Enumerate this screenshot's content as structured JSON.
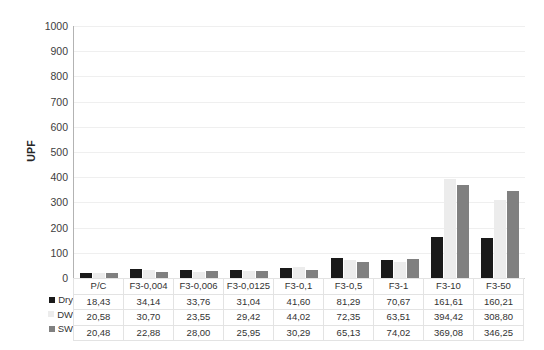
{
  "chart_data": {
    "type": "bar",
    "title": "",
    "xlabel": "",
    "ylabel": "UPF",
    "ylim": [
      0,
      1000
    ],
    "ytick_step": 100,
    "grid": true,
    "legend_position": "data-table-left",
    "categories": [
      "P/C",
      "F3-0,004",
      "F3-0,006",
      "F3-0,0125",
      "F3-0,1",
      "F3-0,5",
      "F3-1",
      "F3-10",
      "F3-50"
    ],
    "yticks": [
      "1000",
      "900",
      "800",
      "700",
      "600",
      "500",
      "400",
      "300",
      "200",
      "100",
      "0"
    ],
    "series": [
      {
        "name": "Dry",
        "color": "#1a1a1a",
        "marker": "black-square",
        "values": [
          18.43,
          34.14,
          33.76,
          31.04,
          41.6,
          81.29,
          70.67,
          161.61,
          160.21
        ],
        "labels": [
          "18,43",
          "34,14",
          "33,76",
          "31,04",
          "41,60",
          "81,29",
          "70,67",
          "161,61",
          "160,21"
        ]
      },
      {
        "name": "DW",
        "color": "#ececec",
        "marker": "light-gray-square",
        "values": [
          20.58,
          30.7,
          23.55,
          29.42,
          44.02,
          72.35,
          63.51,
          394.42,
          308.8
        ],
        "labels": [
          "20,58",
          "30,70",
          "23,55",
          "29,42",
          "44,02",
          "72,35",
          "63,51",
          "394,42",
          "308,80"
        ]
      },
      {
        "name": "SW",
        "color": "#808080",
        "marker": "gray-square",
        "values": [
          20.48,
          22.88,
          28.0,
          25.95,
          30.29,
          65.13,
          74.02,
          369.08,
          346.25
        ],
        "labels": [
          "20,48",
          "22,88",
          "28,00",
          "25,95",
          "30,29",
          "65,13",
          "74,02",
          "369,08",
          "346,25"
        ]
      }
    ]
  },
  "colors": {
    "dry": "#1a1a1a",
    "dw": "#ececec",
    "sw": "#808080",
    "gridline": "#efefef",
    "axis": "#b3b3b3",
    "table_border": "#e3e3e3",
    "text": "#333333"
  }
}
